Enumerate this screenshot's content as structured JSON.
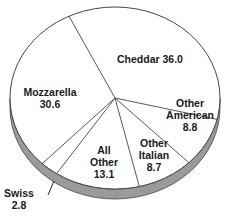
{
  "chart_data": {
    "type": "pie",
    "title": "",
    "units": "percent",
    "style": "3d-oval",
    "start_angle_deg": -116,
    "direction": "clockwise",
    "slices": [
      {
        "label": "Cheddar",
        "value": 36.0,
        "text": [
          "Cheddar 36.0"
        ],
        "lx": 150,
        "ly": 59
      },
      {
        "label": "Other American",
        "value": 8.8,
        "text": [
          "Other",
          "American",
          "8.8"
        ],
        "lx": 190,
        "ly": 115
      },
      {
        "label": "Other Italian",
        "value": 8.7,
        "text": [
          "Other",
          "Italian",
          "8.7"
        ],
        "lx": 154,
        "ly": 155
      },
      {
        "label": "All Other",
        "value": 13.1,
        "text": [
          "All",
          "Other",
          "13.1"
        ],
        "lx": 104,
        "ly": 162
      },
      {
        "label": "Swiss",
        "value": 2.8,
        "text": [
          "Swiss",
          "2.8"
        ],
        "lx": 19,
        "ly": 199
      },
      {
        "label": "Mozzarella",
        "value": 30.6,
        "text": [
          "Mozzarella",
          "30.6"
        ],
        "lx": 50,
        "ly": 98
      }
    ],
    "colors": {
      "face": "#ffffff",
      "edge": "#444444",
      "shadow": "#9a9a9a",
      "text": "#1a1a1a"
    }
  }
}
